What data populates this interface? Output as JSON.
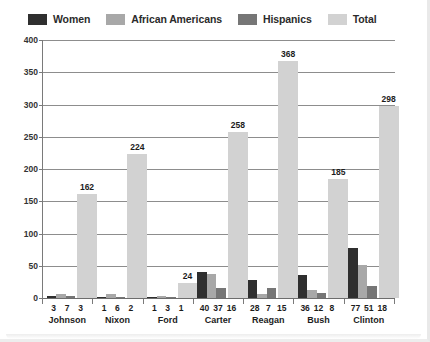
{
  "chart_data": {
    "type": "bar",
    "title": "",
    "xlabel": "",
    "ylabel": "",
    "ylim": [
      0,
      400
    ],
    "ytick_step": 50,
    "yticks": [
      "0",
      "50",
      "100",
      "150",
      "200",
      "250",
      "300",
      "350",
      "400"
    ],
    "grid": true,
    "legend_position": "top-left",
    "categories": [
      "Johnson",
      "Nixon",
      "Ford",
      "Carter",
      "Reagan",
      "Bush",
      "Clinton"
    ],
    "series": [
      {
        "name": "Women",
        "color": "#2f2f2f",
        "values": [
          3,
          1,
          1,
          40,
          28,
          36,
          77
        ]
      },
      {
        "name": "African Americans",
        "color": "#a8a8a8",
        "values": [
          7,
          6,
          3,
          37,
          7,
          12,
          51
        ]
      },
      {
        "name": "Hispanics",
        "color": "#767676",
        "values": [
          3,
          2,
          1,
          16,
          15,
          8,
          18
        ]
      },
      {
        "name": "Total",
        "color": "#d2d2d2",
        "values": [
          162,
          224,
          24,
          258,
          368,
          185,
          298
        ]
      }
    ],
    "total_labels": [
      "162",
      "224",
      "24",
      "258",
      "368",
      "185",
      "298"
    ]
  },
  "legend": {
    "items": [
      {
        "label": "Women",
        "color": "#2f2f2f"
      },
      {
        "label": "African Americans",
        "color": "#a8a8a8"
      },
      {
        "label": "Hispanics",
        "color": "#767676"
      },
      {
        "label": "Total",
        "color": "#d2d2d2"
      }
    ]
  }
}
